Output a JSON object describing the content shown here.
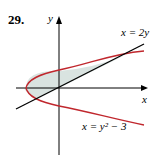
{
  "problem_number": "29.",
  "axes": {
    "x_label": "x",
    "y_label": "y"
  },
  "curves": [
    {
      "equation": "x = 2y",
      "color": "#000000"
    },
    {
      "equation": "x = y² − 3",
      "color": "#c0272d"
    }
  ],
  "region_fill": "#d9e3e0",
  "labels": {
    "line": "x = 2y",
    "parabola": "x = y² − 3"
  }
}
